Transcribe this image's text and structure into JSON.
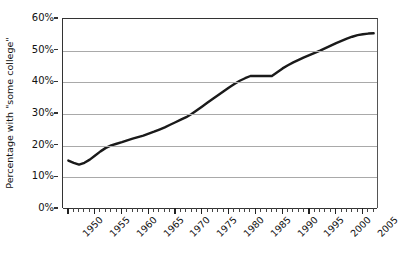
{
  "chart_data": {
    "type": "line",
    "title": "",
    "xlabel": "",
    "ylabel": "Percentage with \"some college\"",
    "xlim": [
      1949,
      2008
    ],
    "ylim": [
      0,
      60
    ],
    "ytick_labels": [
      "0%",
      "10%",
      "20%",
      "30%",
      "40%",
      "50%",
      "60%"
    ],
    "ytick_values": [
      0,
      10,
      20,
      30,
      40,
      50,
      60
    ],
    "xtick_labels": [
      "1950",
      "1955",
      "1960",
      "1965",
      "1970",
      "1975",
      "1980",
      "1985",
      "1990",
      "1995",
      "2000",
      "2005"
    ],
    "xtick_values": [
      1950,
      1955,
      1960,
      1965,
      1970,
      1975,
      1980,
      1985,
      1990,
      1995,
      2000,
      2005
    ],
    "grid": "horizontal",
    "legend": "none",
    "line_color": "#1a1a1a",
    "gridline_color": "#a9a9a9",
    "axis_color": "#333333",
    "background_color": "#ffffff",
    "series": [
      {
        "name": "Percentage with \"some college\"",
        "x": [
          1950,
          1951,
          1952,
          1953,
          1954,
          1955,
          1956,
          1957,
          1958,
          1959,
          1960,
          1961,
          1962,
          1963,
          1964,
          1965,
          1966,
          1967,
          1968,
          1969,
          1970,
          1971,
          1972,
          1973,
          1974,
          1975,
          1976,
          1977,
          1978,
          1979,
          1980,
          1981,
          1982,
          1983,
          1984,
          1985,
          1986,
          1987,
          1988,
          1989,
          1990,
          1991,
          1992,
          1993,
          1994,
          1995,
          1996,
          1997,
          1998,
          1999,
          2000,
          2001,
          2002,
          2003,
          2004,
          2005,
          2006,
          2007
        ],
        "values": [
          15.3,
          14.6,
          14.0,
          14.6,
          15.6,
          16.9,
          18.2,
          19.3,
          20.1,
          20.6,
          21.1,
          21.7,
          22.2,
          22.7,
          23.2,
          23.8,
          24.4,
          25.1,
          25.8,
          26.6,
          27.4,
          28.2,
          29.0,
          30.0,
          31.2,
          32.4,
          33.6,
          34.8,
          36.0,
          37.2,
          38.4,
          39.5,
          40.5,
          41.3,
          42.0,
          42.0,
          42.0,
          42.0,
          42.0,
          43.2,
          44.4,
          45.4,
          46.3,
          47.1,
          47.9,
          48.6,
          49.3,
          50.0,
          50.8,
          51.6,
          52.4,
          53.1,
          53.8,
          54.4,
          54.9,
          55.2,
          55.4,
          55.5
        ]
      }
    ]
  }
}
